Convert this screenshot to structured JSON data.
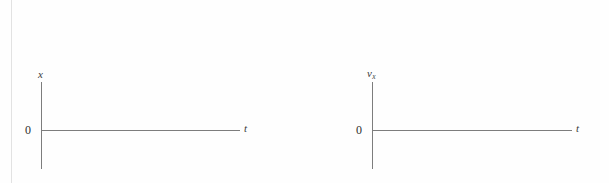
{
  "figure": {
    "background_color": "#fefefe",
    "axis_color": "#7d7d7d",
    "text_color": "#2e2e2e",
    "margin_rule_color": "#e2e2e2"
  },
  "chart_data": [
    {
      "type": "line",
      "title": "",
      "xlabel": "t",
      "ylabel": "x",
      "ylabel_base": "x",
      "ylabel_sub": "",
      "origin_label": "0",
      "series": [
        {
          "name": "x",
          "x": [],
          "values": []
        }
      ],
      "x": [],
      "values": [],
      "categories": [],
      "grid": false,
      "legend": false,
      "xlim": [
        0,
        1
      ],
      "ylim": [
        -1,
        1
      ],
      "note": "empty axes, no data plotted"
    },
    {
      "type": "line",
      "title": "",
      "xlabel": "t",
      "ylabel": "v_x",
      "ylabel_base": "v",
      "ylabel_sub": "x",
      "origin_label": "0",
      "series": [
        {
          "name": "v_x",
          "x": [],
          "values": []
        }
      ],
      "x": [],
      "values": [],
      "categories": [],
      "grid": false,
      "legend": false,
      "xlim": [
        0,
        1
      ],
      "ylim": [
        -1,
        1
      ],
      "note": "empty axes, no data plotted"
    }
  ]
}
